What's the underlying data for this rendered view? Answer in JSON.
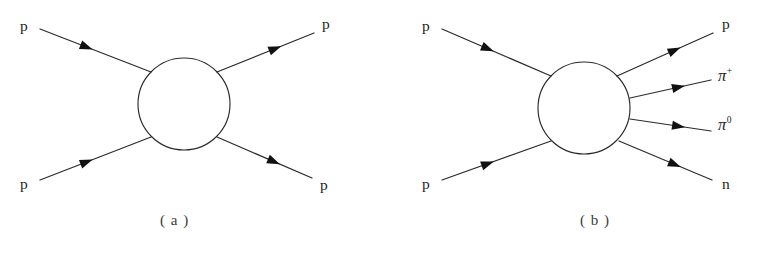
{
  "figure": {
    "background_color": "#ffffff",
    "line_color": "#2b2b2b",
    "text_color": "#231f20",
    "width": 764,
    "height": 266
  },
  "panels": [
    {
      "id": "a",
      "caption": "( a )",
      "blob": {
        "cx": 184,
        "cy": 104,
        "r": 46
      },
      "incoming": [
        {
          "name": "p",
          "symbol": "p",
          "superscript": "",
          "label_x": 20,
          "label_y": 18,
          "x1": 40,
          "y1": 29,
          "x2": 151,
          "y2": 72
        },
        {
          "name": "p",
          "symbol": "p",
          "superscript": "",
          "label_x": 20,
          "label_y": 176,
          "x1": 40,
          "y1": 180,
          "x2": 151,
          "y2": 137
        }
      ],
      "outgoing": [
        {
          "name": "p",
          "symbol": "p",
          "superscript": "",
          "label_x": 322,
          "label_y": 16,
          "x1": 217,
          "y1": 72,
          "x2": 314,
          "y2": 33
        },
        {
          "name": "p",
          "symbol": "p",
          "superscript": "",
          "label_x": 320,
          "label_y": 177,
          "x1": 217,
          "y1": 137,
          "x2": 312,
          "y2": 178
        }
      ]
    },
    {
      "id": "b",
      "caption": "( b )",
      "blob": {
        "cx": 584,
        "cy": 108,
        "r": 46
      },
      "incoming": [
        {
          "name": "p",
          "symbol": "p",
          "superscript": "",
          "label_x": 422,
          "label_y": 18,
          "x1": 442,
          "y1": 29,
          "x2": 551,
          "y2": 76
        },
        {
          "name": "p",
          "symbol": "p",
          "superscript": "",
          "label_x": 422,
          "label_y": 176,
          "x1": 442,
          "y1": 180,
          "x2": 551,
          "y2": 141
        }
      ],
      "outgoing": [
        {
          "name": "p",
          "symbol": "p",
          "superscript": "",
          "label_x": 722,
          "label_y": 16,
          "x1": 617,
          "y1": 76,
          "x2": 713,
          "y2": 33
        },
        {
          "name": "pi-plus",
          "symbol": "π",
          "superscript": "+",
          "label_x": 718,
          "label_y": 68,
          "x1": 630,
          "y1": 98,
          "x2": 711,
          "y2": 80
        },
        {
          "name": "pi-zero",
          "symbol": "π",
          "superscript": "0",
          "label_x": 718,
          "label_y": 117,
          "x1": 630,
          "y1": 119,
          "x2": 711,
          "y2": 131
        },
        {
          "name": "n",
          "symbol": "n",
          "superscript": "",
          "label_x": 722,
          "label_y": 176,
          "x1": 619,
          "y1": 141,
          "x2": 712,
          "y2": 180
        }
      ]
    }
  ]
}
